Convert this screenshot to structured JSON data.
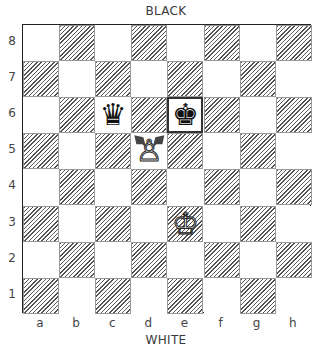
{
  "labels": {
    "top": "BLACK",
    "bottom": "WHITE"
  },
  "ranks": [
    "8",
    "7",
    "6",
    "5",
    "4",
    "3",
    "2",
    "1"
  ],
  "files": [
    "a",
    "b",
    "c",
    "d",
    "e",
    "f",
    "g",
    "h"
  ],
  "colors": {
    "dark_hatch": "#555555",
    "light": "#ffffff",
    "border": "#222222"
  },
  "highlighted_square": "e6",
  "pieces": [
    {
      "square": "c6",
      "color": "black",
      "type": "queen",
      "glyph": "♛"
    },
    {
      "square": "e6",
      "color": "black",
      "type": "king",
      "glyph": "♚"
    },
    {
      "square": "d5",
      "color": "white",
      "type": "pawn",
      "glyph": "♙"
    },
    {
      "square": "e3",
      "color": "white",
      "type": "king",
      "glyph": "♔"
    }
  ],
  "arrows": [
    {
      "from": "d5",
      "to": "c6",
      "meaning": "pawn capture direction"
    },
    {
      "from": "d5",
      "to": "e6",
      "meaning": "pawn capture direction"
    }
  ]
}
